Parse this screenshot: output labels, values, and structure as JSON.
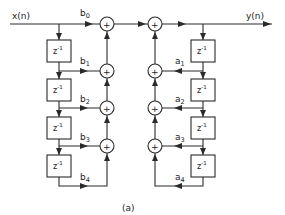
{
  "diagram": {
    "type": "IIR filter direct form signal-flow graph",
    "input_label": "x(n)",
    "output_label": "y(n)",
    "caption": "(a)",
    "delay_label": {
      "base": "z",
      "exp": "-1"
    },
    "feedforward": {
      "coefficients": [
        {
          "name": "b",
          "sub": "0"
        },
        {
          "name": "b",
          "sub": "1"
        },
        {
          "name": "b",
          "sub": "2"
        },
        {
          "name": "b",
          "sub": "3"
        },
        {
          "name": "b",
          "sub": "4"
        }
      ],
      "delay_count": 4
    },
    "feedback": {
      "coefficients": [
        {
          "name": "a",
          "sub": "1"
        },
        {
          "name": "a",
          "sub": "2"
        },
        {
          "name": "a",
          "sub": "3"
        },
        {
          "name": "a",
          "sub": "4"
        }
      ],
      "delay_count": 4
    },
    "adder_symbol": "+",
    "colors": {
      "line": "#2a2a2a",
      "background": "#ffffff"
    }
  }
}
